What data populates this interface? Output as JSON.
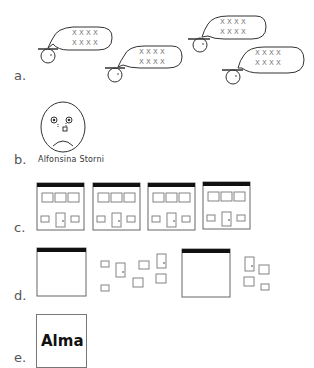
{
  "panels": {
    "a": {
      "label": "a.",
      "description": "four speaking figures with speech bubbles",
      "bubble_text_rows": [
        "X X X X",
        "X X X X"
      ]
    },
    "b": {
      "label": "b.",
      "description": "sad face with tear",
      "caption": "Alfonsina Storni"
    },
    "c": {
      "label": "c.",
      "description": "four building facades",
      "building_count": 4
    },
    "d": {
      "label": "d.",
      "description": "two blank facades with scattered windows and doors"
    },
    "e": {
      "label": "e.",
      "box_text": "Alma"
    }
  },
  "colors": {
    "stroke": "#333333",
    "light_stroke": "#777777",
    "roof": "#111111",
    "text": "#555555"
  }
}
